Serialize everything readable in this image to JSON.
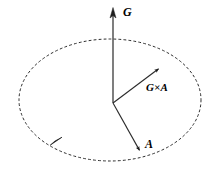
{
  "figure": {
    "background_color": "#ffffff",
    "stroke_color": "#1a1a1a",
    "width": 216,
    "height": 174
  },
  "labels": {
    "g": "G",
    "g_cross_a": "G×A",
    "a": "A"
  },
  "chart_data": {
    "type": "diagram",
    "title": "",
    "origin": {
      "x": 113,
      "y": 103
    },
    "orbit_ellipse": {
      "name": "precession-circle",
      "center_x": 110,
      "center_y": 100,
      "radius_x": 91,
      "radius_y": 61,
      "style": "dashed",
      "dash_pattern": "2 3",
      "stroke_width": 1,
      "color": "#2b2b2b"
    },
    "direction_marker": {
      "name": "orbit-direction-arrow",
      "x": 56,
      "y": 142,
      "angle_deg": 215,
      "color": "#111111"
    },
    "vectors": [
      {
        "name": "G",
        "label": "G",
        "from_x": 113,
        "from_y": 103,
        "to_x": 113,
        "to_y": 9,
        "label_x": 123,
        "label_y": 6,
        "color": "#3a3a3a",
        "stroke_width": 1.3
      },
      {
        "name": "GxA",
        "label": "G×A",
        "from_x": 113,
        "from_y": 103,
        "to_x": 161,
        "to_y": 67,
        "label_x": 146,
        "label_y": 82,
        "color": "#2a2a2a",
        "stroke_width": 1.1
      },
      {
        "name": "A",
        "label": "A",
        "from_x": 113,
        "from_y": 103,
        "to_x": 141,
        "to_y": 153,
        "label_x": 145,
        "label_y": 138,
        "color": "#2a2a2a",
        "stroke_width": 1.1
      }
    ],
    "xlabel": "",
    "ylabel": "",
    "grid": false,
    "legend": false
  }
}
